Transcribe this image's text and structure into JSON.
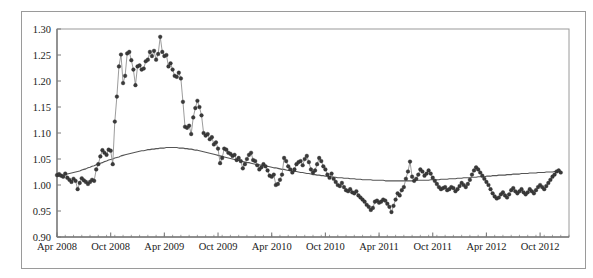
{
  "chart_data": {
    "type": "line",
    "title": "",
    "subtitle": "",
    "xlabel": "",
    "ylabel": "",
    "grid": false,
    "legend": "none",
    "ylim": [
      0.9,
      1.3
    ],
    "ytick_labels": [
      "1.30",
      "1.25",
      "1.20",
      "1.15",
      "1.10",
      "1.05",
      "1.00",
      "0.95",
      "0.90"
    ],
    "ytick_values": [
      1.3,
      1.25,
      1.2,
      1.15,
      1.1,
      1.05,
      1.0,
      0.95,
      0.9
    ],
    "xtick_labels": [
      "Apr 2008",
      "Oct 2008",
      "Apr 2009",
      "Oct 2009",
      "Apr 2010",
      "Oct 2010",
      "Apr 2011",
      "Oct 2011",
      "Apr 2012",
      "Oct 2012"
    ],
    "xtick_index": [
      0,
      26,
      52,
      78,
      104,
      130,
      156,
      182,
      208,
      234
    ],
    "xlim_index": [
      0,
      248
    ],
    "series": [
      {
        "name": "observed",
        "style": "line-with-markers",
        "color": "#3a3a3a",
        "marker": "circle",
        "marker_size": 3,
        "values": [
          1.019,
          1.021,
          1.018,
          1.016,
          1.022,
          1.014,
          1.01,
          1.006,
          1.012,
          1.008,
          0.992,
          1.004,
          1.013,
          1.009,
          1.006,
          1.002,
          1.006,
          1.01,
          1.008,
          1.03,
          1.04,
          1.055,
          1.067,
          1.062,
          1.058,
          1.068,
          1.066,
          1.04,
          1.122,
          1.17,
          1.228,
          1.251,
          1.196,
          1.21,
          1.253,
          1.256,
          1.24,
          1.222,
          1.192,
          1.228,
          1.23,
          1.222,
          1.224,
          1.238,
          1.241,
          1.256,
          1.248,
          1.258,
          1.241,
          1.252,
          1.285,
          1.256,
          1.248,
          1.25,
          1.228,
          1.234,
          1.222,
          1.21,
          1.208,
          1.216,
          1.205,
          1.16,
          1.112,
          1.11,
          1.114,
          1.098,
          1.13,
          1.148,
          1.162,
          1.15,
          1.134,
          1.1,
          1.095,
          1.098,
          1.088,
          1.092,
          1.078,
          1.082,
          1.07,
          1.042,
          1.052,
          1.07,
          1.068,
          1.062,
          1.06,
          1.056,
          1.058,
          1.048,
          1.052,
          1.046,
          1.032,
          1.04,
          1.05,
          1.058,
          1.062,
          1.048,
          1.046,
          1.038,
          1.03,
          1.034,
          1.04,
          1.036,
          1.028,
          1.018,
          1.016,
          1.02,
          1.0,
          1.002,
          1.01,
          1.02,
          1.052,
          1.046,
          1.036,
          1.03,
          1.024,
          1.03,
          1.04,
          1.044,
          1.046,
          1.038,
          1.05,
          1.056,
          1.044,
          1.03,
          1.024,
          1.028,
          1.04,
          1.052,
          1.046,
          1.036,
          1.03,
          1.02,
          1.014,
          1.022,
          1.012,
          1.006,
          1.0,
          0.998,
          1.004,
          0.996,
          0.99,
          0.988,
          0.992,
          0.986,
          0.984,
          0.988,
          0.98,
          0.976,
          0.972,
          0.968,
          0.962,
          0.958,
          0.952,
          0.956,
          0.968,
          0.97,
          0.966,
          0.968,
          0.972,
          0.97,
          0.964,
          0.958,
          0.948,
          0.96,
          0.972,
          0.984,
          0.98,
          0.99,
          0.996,
          1.012,
          1.026,
          1.045,
          1.016,
          1.008,
          1.012,
          1.02,
          1.03,
          1.026,
          1.018,
          1.022,
          1.028,
          1.022,
          1.014,
          1.008,
          1.002,
          0.996,
          0.992,
          0.994,
          0.996,
          0.99,
          0.992,
          0.996,
          0.994,
          0.988,
          0.992,
          0.998,
          1.004,
          1.0,
          0.996,
          1.002,
          1.01,
          1.02,
          1.028,
          1.034,
          1.03,
          1.024,
          1.018,
          1.012,
          1.006,
          1.0,
          0.992,
          0.984,
          0.978,
          0.974,
          0.976,
          0.982,
          0.986,
          0.98,
          0.976,
          0.982,
          0.99,
          0.994,
          0.988,
          0.984,
          0.988,
          0.992,
          0.986,
          0.982,
          0.986,
          0.992,
          0.988,
          0.984,
          0.99,
          0.996,
          1.0,
          0.996,
          0.992,
          0.998,
          1.004,
          1.01,
          1.016,
          1.02,
          1.026,
          1.028,
          1.024
        ]
      },
      {
        "name": "trend",
        "style": "smooth-line",
        "color": "#555555",
        "marker": "none",
        "values": [
          1.016,
          1.017,
          1.018,
          1.019,
          1.02,
          1.021,
          1.022,
          1.023,
          1.024,
          1.025,
          1.026,
          1.027,
          1.029,
          1.03,
          1.031,
          1.033,
          1.034,
          1.036,
          1.037,
          1.039,
          1.04,
          1.042,
          1.043,
          1.045,
          1.046,
          1.048,
          1.049,
          1.05,
          1.052,
          1.053,
          1.054,
          1.056,
          1.057,
          1.058,
          1.059,
          1.06,
          1.061,
          1.062,
          1.063,
          1.064,
          1.065,
          1.066,
          1.066,
          1.067,
          1.068,
          1.068,
          1.069,
          1.069,
          1.07,
          1.07,
          1.071,
          1.071,
          1.071,
          1.072,
          1.072,
          1.072,
          1.072,
          1.072,
          1.072,
          1.071,
          1.071,
          1.071,
          1.07,
          1.07,
          1.069,
          1.069,
          1.068,
          1.067,
          1.067,
          1.066,
          1.065,
          1.064,
          1.063,
          1.062,
          1.061,
          1.06,
          1.059,
          1.058,
          1.057,
          1.056,
          1.055,
          1.054,
          1.053,
          1.052,
          1.051,
          1.05,
          1.049,
          1.048,
          1.047,
          1.046,
          1.045,
          1.044,
          1.043,
          1.043,
          1.042,
          1.041,
          1.04,
          1.039,
          1.039,
          1.038,
          1.037,
          1.036,
          1.036,
          1.035,
          1.034,
          1.033,
          1.033,
          1.032,
          1.031,
          1.03,
          1.03,
          1.029,
          1.028,
          1.028,
          1.027,
          1.026,
          1.026,
          1.025,
          1.024,
          1.024,
          1.023,
          1.022,
          1.022,
          1.021,
          1.02,
          1.02,
          1.019,
          1.019,
          1.018,
          1.018,
          1.017,
          1.017,
          1.016,
          1.016,
          1.015,
          1.015,
          1.014,
          1.014,
          1.014,
          1.013,
          1.013,
          1.013,
          1.012,
          1.012,
          1.012,
          1.011,
          1.011,
          1.011,
          1.01,
          1.01,
          1.01,
          1.01,
          1.01,
          1.009,
          1.009,
          1.009,
          1.009,
          1.009,
          1.009,
          1.008,
          1.008,
          1.008,
          1.008,
          1.008,
          1.008,
          1.008,
          1.008,
          1.008,
          1.008,
          1.008,
          1.008,
          1.008,
          1.008,
          1.008,
          1.009,
          1.009,
          1.009,
          1.009,
          1.009,
          1.009,
          1.009,
          1.01,
          1.01,
          1.01,
          1.01,
          1.01,
          1.011,
          1.011,
          1.011,
          1.011,
          1.012,
          1.012,
          1.012,
          1.012,
          1.013,
          1.013,
          1.013,
          1.014,
          1.014,
          1.014,
          1.014,
          1.015,
          1.015,
          1.015,
          1.016,
          1.016,
          1.016,
          1.016,
          1.017,
          1.017,
          1.017,
          1.018,
          1.018,
          1.018,
          1.019,
          1.019,
          1.019,
          1.019,
          1.02,
          1.02,
          1.02,
          1.021,
          1.021,
          1.021,
          1.021,
          1.022,
          1.022,
          1.022,
          1.022,
          1.023,
          1.023,
          1.023,
          1.023,
          1.024,
          1.024,
          1.024,
          1.024,
          1.025,
          1.025,
          1.025,
          1.025,
          1.026,
          1.026,
          1.026,
          1.027
        ]
      }
    ],
    "colors": {
      "marker": "#3a3a3a",
      "connector": "#8a8a8a",
      "trend": "#555555",
      "axis": "#7a7a7a",
      "frame": "#9a9a9a",
      "text": "#1a1a1a",
      "background": "#ffffff"
    }
  }
}
